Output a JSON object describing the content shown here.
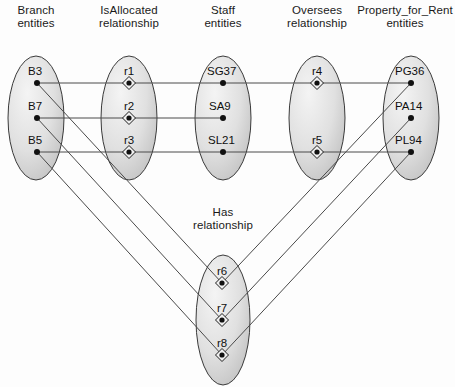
{
  "diagram": {
    "background": "#fdfdfd",
    "ellipse_fill_light": "#f2f2f2",
    "ellipse_fill_dark": "#bdbdbd",
    "ellipse_stroke": "#3a3a3a",
    "line_color": "#4a4a4a",
    "node_color": "#111111"
  },
  "columns": [
    {
      "id": "branch",
      "title_line1": "Branch",
      "title_line2": "entities",
      "cx": 36,
      "cy": 118,
      "rx": 28,
      "ry": 62,
      "title_x": 36,
      "title_y": 4
    },
    {
      "id": "isallocated",
      "title_line1": "IsAllocated",
      "title_line2": "relationship",
      "cx": 129,
      "cy": 118,
      "rx": 28,
      "ry": 62,
      "title_x": 129,
      "title_y": 4
    },
    {
      "id": "staff",
      "title_line1": "Staff",
      "title_line2": "entities",
      "cx": 223,
      "cy": 118,
      "rx": 28,
      "ry": 62,
      "title_x": 223,
      "title_y": 4
    },
    {
      "id": "oversees",
      "title_line1": "Oversees",
      "title_line2": "relationship",
      "cx": 317,
      "cy": 118,
      "rx": 28,
      "ry": 62,
      "title_x": 317,
      "title_y": 4
    },
    {
      "id": "property",
      "title_line1": "Property_for_Rent",
      "title_line2": "entities",
      "cx": 411,
      "cy": 118,
      "rx": 28,
      "ry": 62,
      "title_x": 405,
      "title_y": 4
    },
    {
      "id": "has",
      "title_line1": "Has",
      "title_line2": "relationship",
      "cx": 223,
      "cy": 320,
      "rx": 27,
      "ry": 65,
      "title_x": 223,
      "title_y": 206
    }
  ],
  "nodes": [
    {
      "id": "B3",
      "label": "B3",
      "type": "entity",
      "column": "branch",
      "x": 37,
      "y": 83,
      "label_dx": -9,
      "label_dy": -18
    },
    {
      "id": "B7",
      "label": "B7",
      "type": "entity",
      "column": "branch",
      "x": 37,
      "y": 118,
      "label_dx": -9,
      "label_dy": -18
    },
    {
      "id": "B5",
      "label": "B5",
      "type": "entity",
      "column": "branch",
      "x": 37,
      "y": 152,
      "label_dx": -9,
      "label_dy": -18
    },
    {
      "id": "r1",
      "label": "r1",
      "type": "relationship",
      "column": "isallocated",
      "x": 129,
      "y": 83,
      "label_dx": -5,
      "label_dy": -18
    },
    {
      "id": "r2",
      "label": "r2",
      "type": "relationship",
      "column": "isallocated",
      "x": 129,
      "y": 118,
      "label_dx": -5,
      "label_dy": -18
    },
    {
      "id": "r3",
      "label": "r3",
      "type": "relationship",
      "column": "isallocated",
      "x": 129,
      "y": 152,
      "label_dx": -5,
      "label_dy": -18
    },
    {
      "id": "SG37",
      "label": "SG37",
      "type": "entity",
      "column": "staff",
      "x": 223,
      "y": 83,
      "label_dx": -16,
      "label_dy": -18
    },
    {
      "id": "SA9",
      "label": "SA9",
      "type": "entity",
      "column": "staff",
      "x": 223,
      "y": 118,
      "label_dx": -14,
      "label_dy": -18
    },
    {
      "id": "SL21",
      "label": "SL21",
      "type": "entity",
      "column": "staff",
      "x": 223,
      "y": 152,
      "label_dx": -15,
      "label_dy": -18
    },
    {
      "id": "r4",
      "label": "r4",
      "type": "relationship",
      "column": "oversees",
      "x": 317,
      "y": 83,
      "label_dx": -5,
      "label_dy": -18
    },
    {
      "id": "r5",
      "label": "r5",
      "type": "relationship",
      "column": "oversees",
      "x": 317,
      "y": 152,
      "label_dx": -5,
      "label_dy": -18
    },
    {
      "id": "PG36",
      "label": "PG36",
      "type": "entity",
      "column": "property",
      "x": 411,
      "y": 83,
      "label_dx": -16,
      "label_dy": -18
    },
    {
      "id": "PA14",
      "label": "PA14",
      "type": "entity",
      "column": "property",
      "x": 411,
      "y": 118,
      "label_dx": -16,
      "label_dy": -18
    },
    {
      "id": "PL94",
      "label": "PL94",
      "type": "entity",
      "column": "property",
      "x": 411,
      "y": 152,
      "label_dx": -16,
      "label_dy": -18
    },
    {
      "id": "r6",
      "label": "r6",
      "type": "relationship",
      "column": "has",
      "x": 222,
      "y": 283,
      "label_dx": -5,
      "label_dy": -18
    },
    {
      "id": "r7",
      "label": "r7",
      "type": "relationship",
      "column": "has",
      "x": 222,
      "y": 320,
      "label_dx": -5,
      "label_dy": -18
    },
    {
      "id": "r8",
      "label": "r8",
      "type": "relationship",
      "column": "has",
      "x": 222,
      "y": 355,
      "label_dx": -5,
      "label_dy": -18
    }
  ],
  "edges": [
    {
      "from": "B3",
      "to": "r1"
    },
    {
      "from": "r1",
      "to": "SG37"
    },
    {
      "from": "SG37",
      "to": "r4"
    },
    {
      "from": "r4",
      "to": "PG36"
    },
    {
      "from": "B7",
      "to": "r2"
    },
    {
      "from": "r2",
      "to": "SA9"
    },
    {
      "from": "B5",
      "to": "r3"
    },
    {
      "from": "r3",
      "to": "SL21"
    },
    {
      "from": "SL21",
      "to": "r5"
    },
    {
      "from": "r5",
      "to": "PL94"
    },
    {
      "from": "B3",
      "to": "r6"
    },
    {
      "from": "B7",
      "to": "r7"
    },
    {
      "from": "B5",
      "to": "r8"
    },
    {
      "from": "r6",
      "to": "PG36"
    },
    {
      "from": "r7",
      "to": "PA14"
    },
    {
      "from": "r8",
      "to": "PL94"
    }
  ]
}
